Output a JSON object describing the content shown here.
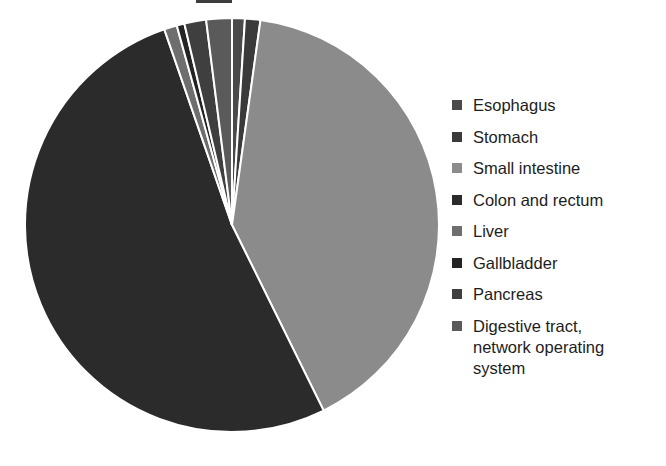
{
  "chart_data": {
    "type": "pie",
    "title": "",
    "legend_position": "right",
    "labels": [
      "Esophagus",
      "Stomach",
      "Small intestine",
      "Colon and rectum",
      "Liver",
      "Gallbladder",
      "Pancreas",
      "Digestive tract,\nnetwork operating\nsystem"
    ],
    "values": [
      1.0,
      1.2,
      40.5,
      52.0,
      1.0,
      0.6,
      1.7,
      2.0
    ],
    "colors": [
      "#4a4a4a",
      "#3a3a3a",
      "#8b8b8b",
      "#2b2b2b",
      "#6e6e6e",
      "#242424",
      "#3f3f3f",
      "#5a5a5a"
    ],
    "slice_border_color": "#ffffff",
    "start_angle_deg": 0,
    "direction": "clockwise"
  },
  "legend": {
    "items": [
      {
        "label": "Esophagus",
        "color": "#4a4a4a"
      },
      {
        "label": "Stomach",
        "color": "#3a3a3a"
      },
      {
        "label": "Small intestine",
        "color": "#8b8b8b"
      },
      {
        "label": "Colon and rectum",
        "color": "#2b2b2b"
      },
      {
        "label": "Liver",
        "color": "#6e6e6e"
      },
      {
        "label": "Gallbladder",
        "color": "#242424"
      },
      {
        "label": "Pancreas",
        "color": "#3f3f3f"
      },
      {
        "label": "Digestive tract,\nnetwork operating\nsystem",
        "color": "#5a5a5a"
      }
    ]
  },
  "geometry": {
    "center_x": 232,
    "center_y": 225,
    "radius": 207
  }
}
